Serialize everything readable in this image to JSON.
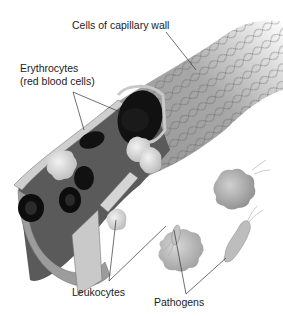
{
  "diagram": {
    "labels": {
      "capillary_wall": "Cells of capillary wall",
      "erythrocytes_line1": "Erythrocytes",
      "erythrocytes_line2": "(red blood cells)",
      "leukocytes": "Leukocytes",
      "pathogens": "Pathogens"
    },
    "colors": {
      "background": "#ffffff",
      "wall_cells": "#9a9a9a",
      "wall_cell_outline": "#555555",
      "lumen": "#4a4a4a",
      "erythrocyte": "#111111",
      "leukocyte": "#d8d8d8",
      "pathogen": "#b0b0b0",
      "leader_line": "#333333",
      "text": "#222222"
    }
  }
}
